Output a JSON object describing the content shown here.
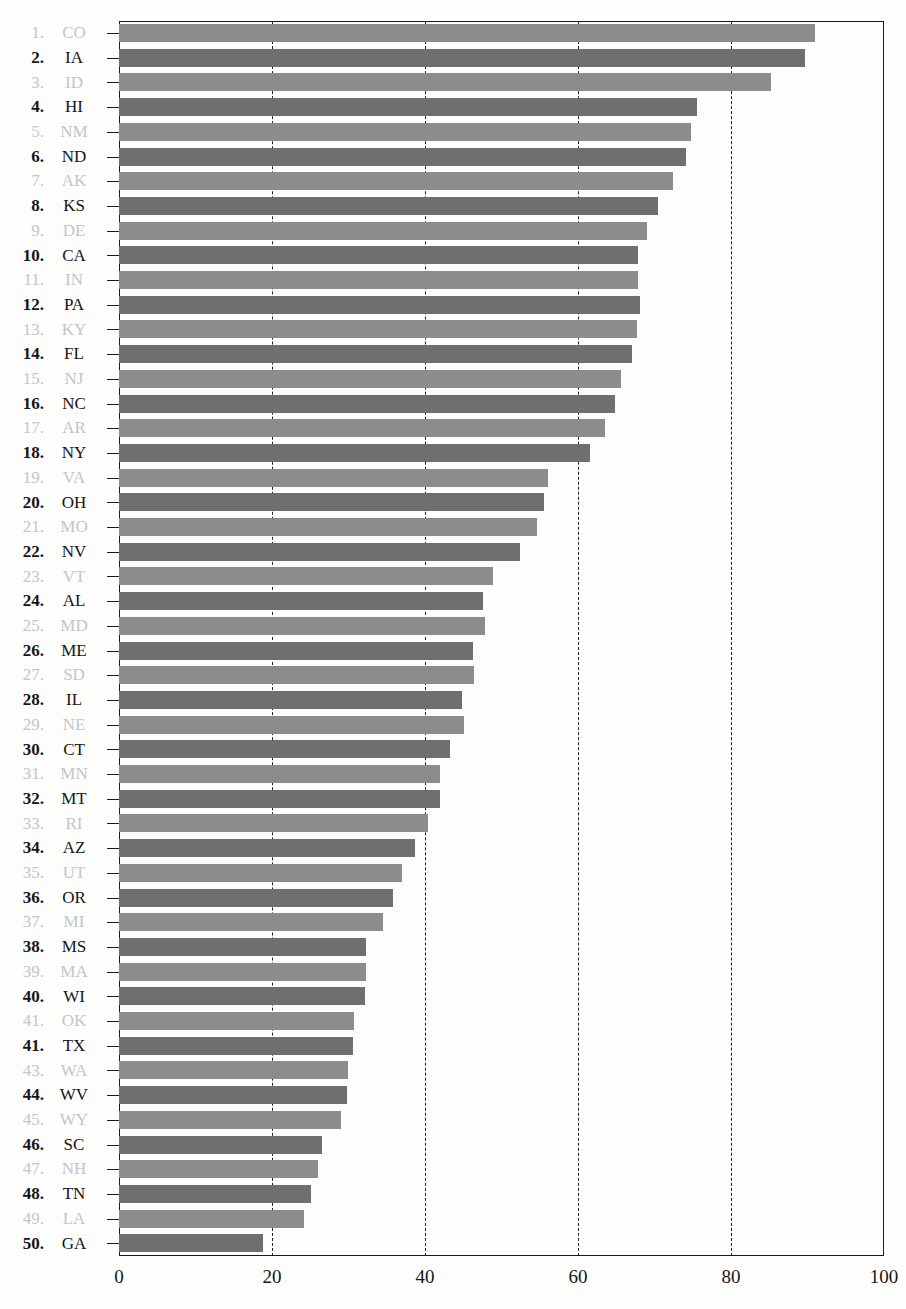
{
  "title_ghost": "",
  "chart_data": {
    "type": "bar",
    "orientation": "horizontal",
    "title": "",
    "xlabel": "",
    "ylabel": "",
    "xlim": [
      0,
      100
    ],
    "xticks": [
      0,
      20,
      40,
      60,
      80,
      100
    ],
    "grid": "vertical dashed gridlines at 20, 40, 60, 80",
    "legend": "none",
    "colors": {
      "odd_row_bar": "#8c8c8c",
      "even_row_bar": "#6f6f6f",
      "axis": "#1a1a1a",
      "label_dark": "#151515",
      "label_light": "#c2c6cb"
    },
    "rank_labels": [
      "1.",
      "2.",
      "3.",
      "4.",
      "5.",
      "6.",
      "7.",
      "8.",
      "9.",
      "10.",
      "11.",
      "12.",
      "13.",
      "14.",
      "15.",
      "16.",
      "17.",
      "18.",
      "19.",
      "20.",
      "21.",
      "22.",
      "23.",
      "24.",
      "25.",
      "26.",
      "27.",
      "28.",
      "29.",
      "30.",
      "31.",
      "32.",
      "33.",
      "34.",
      "35.",
      "36.",
      "37.",
      "38.",
      "39.",
      "40.",
      "41.",
      "41.",
      "43.",
      "44.",
      "45.",
      "46.",
      "47.",
      "48.",
      "49.",
      "50."
    ],
    "categories": [
      "CO",
      "IA",
      "ID",
      "HI",
      "NM",
      "ND",
      "AK",
      "KS",
      "DE",
      "CA",
      "IN",
      "PA",
      "KY",
      "FL",
      "NJ",
      "NC",
      "AR",
      "NY",
      "VA",
      "OH",
      "MO",
      "NV",
      "VT",
      "AL",
      "MD",
      "ME",
      "SD",
      "IL",
      "NE",
      "CT",
      "MN",
      "MT",
      "RI",
      "AZ",
      "UT",
      "OR",
      "MI",
      "MS",
      "MA",
      "WI",
      "OK",
      "TX",
      "WA",
      "WV",
      "WY",
      "SC",
      "NH",
      "TN",
      "LA",
      "GA"
    ],
    "values": [
      91.0,
      89.7,
      85.2,
      75.6,
      74.8,
      74.1,
      72.4,
      70.5,
      69.0,
      67.8,
      67.8,
      68.1,
      67.7,
      67.0,
      65.6,
      64.8,
      63.5,
      61.6,
      56.1,
      55.6,
      54.7,
      52.4,
      48.9,
      47.6,
      47.9,
      46.3,
      46.4,
      44.8,
      45.1,
      43.3,
      42.0,
      42.0,
      40.4,
      38.7,
      37.0,
      35.8,
      34.5,
      32.3,
      32.3,
      32.2,
      30.7,
      30.6,
      29.9,
      29.8,
      29.0,
      26.5,
      26.0,
      25.1,
      24.2,
      18.8
    ]
  },
  "axis": {
    "tick_labels": [
      "0",
      "20",
      "40",
      "60",
      "80",
      "100"
    ]
  }
}
